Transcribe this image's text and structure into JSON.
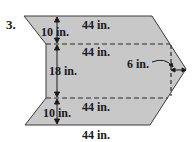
{
  "problem": {
    "number": "3.",
    "figure": {
      "fill_color": "#c8c8c8",
      "stroke_color": "#3a3a3a",
      "labels": {
        "top_edge": "44 in.",
        "top_height": "10 in.",
        "upper_dashed": "44 in.",
        "middle_height": "18 in.",
        "lower_dashed": "44 in.",
        "bottom_height": "10 in.",
        "bottom_edge": "44 in.",
        "tip_width": "6 in."
      }
    }
  }
}
